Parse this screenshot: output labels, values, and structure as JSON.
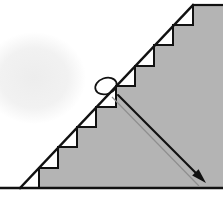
{
  "figure": {
    "canvas": {
      "width": 223,
      "height": 201,
      "background": "#ffffff"
    },
    "colors": {
      "fill_grey": "#b4b4b4",
      "stroke_black": "#111111",
      "line_light_grey": "#8f8f8f",
      "background_shadow": "#ededed",
      "white": "#ffffff"
    },
    "triangle": {
      "label": "right-triangle",
      "vertices": [
        {
          "name": "bottom-left",
          "x": 20,
          "y": 188
        },
        {
          "name": "bottom-right",
          "x": 223,
          "y": 188
        },
        {
          "name": "apex-top",
          "x": 193,
          "y": 5
        }
      ],
      "baseline": {
        "x1": 0,
        "y1": 188,
        "x2": 223,
        "y2": 188
      },
      "hypotenuse": {
        "x1": 20,
        "y1": 188,
        "x2": 193,
        "y2": 5
      }
    },
    "staircase": {
      "label": "staircase-steps",
      "step_count": 9,
      "notch_color": "#ffffff",
      "description": "White right-triangular notches between the straight hypotenuse and the stepped boundary",
      "steps": [
        {
          "index": 1,
          "tread_x1": 20,
          "tread_x2": 39,
          "tread_y": 188,
          "riser_x": 39,
          "riser_y1": 188,
          "riser_y2": 168
        },
        {
          "index": 2,
          "tread_x1": 39,
          "tread_x2": 58,
          "tread_y": 168,
          "riser_x": 58,
          "riser_y1": 168,
          "riser_y2": 147
        },
        {
          "index": 3,
          "tread_x1": 58,
          "tread_x2": 77,
          "tread_y": 147,
          "riser_x": 77,
          "riser_y1": 147,
          "riser_y2": 127
        },
        {
          "index": 4,
          "tread_x1": 77,
          "tread_x2": 96,
          "tread_y": 127,
          "riser_x": 96,
          "riser_y1": 127,
          "riser_y2": 107
        },
        {
          "index": 5,
          "tread_x1": 96,
          "tread_x2": 116,
          "tread_y": 107,
          "riser_x": 116,
          "riser_y1": 107,
          "riser_y2": 86
        },
        {
          "index": 6,
          "tread_x1": 116,
          "tread_x2": 135,
          "tread_y": 86,
          "riser_x": 135,
          "riser_y1": 86,
          "riser_y2": 66
        },
        {
          "index": 7,
          "tread_x1": 135,
          "tread_x2": 154,
          "tread_y": 66,
          "riser_x": 154,
          "riser_y1": 66,
          "riser_y2": 45
        },
        {
          "index": 8,
          "tread_x1": 154,
          "tread_x2": 173,
          "tread_y": 45,
          "riser_x": 173,
          "riser_y1": 45,
          "riser_y2": 25
        },
        {
          "index": 9,
          "tread_x1": 173,
          "tread_x2": 193,
          "tread_y": 25,
          "riser_x": 193,
          "riser_y1": 25,
          "riser_y2": 5
        }
      ]
    },
    "arc_loop": {
      "label": "small-ellipse-loop",
      "center_x": 106,
      "center_y": 86,
      "radius_x": 11,
      "radius_y": 8,
      "rotation_deg": -20,
      "stroke": "#111111"
    },
    "arrow": {
      "label": "radius-arrow",
      "x1": 118,
      "y1": 95,
      "x2": 206,
      "y2": 183,
      "head_length": 15,
      "head_width": 9,
      "stroke": "#111111",
      "stroke_width": 2.1
    },
    "light_line": {
      "label": "secondary-grey-line",
      "x1": 112,
      "y1": 97,
      "x2": 199,
      "y2": 186,
      "stroke": "#8f8f8f",
      "stroke_width": 1.2
    },
    "background_shadow": {
      "label": "background-soft-shadow",
      "center_x": 34,
      "center_y": 78,
      "radius_x": 52,
      "radius_y": 46,
      "color": "#ededed"
    }
  }
}
